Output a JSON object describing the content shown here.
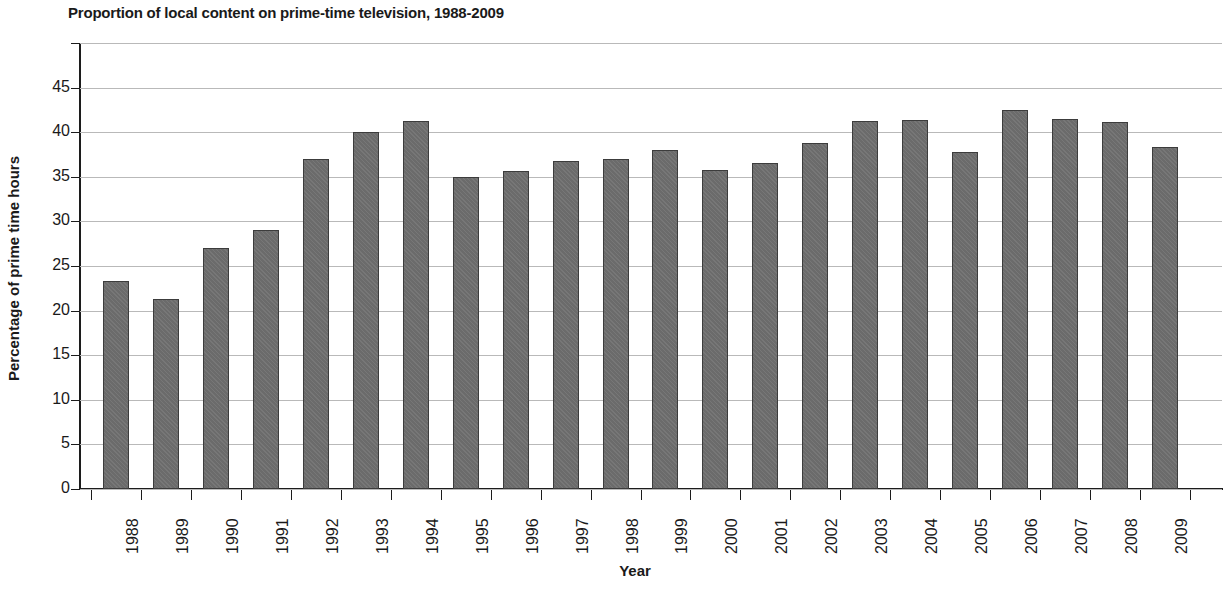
{
  "chart_data": {
    "type": "bar",
    "title": "Proportion of local content on prime-time television, 1988-2009",
    "xlabel": "Year",
    "ylabel": "Percentage of prime time hours",
    "categories": [
      "1988",
      "1989",
      "1990",
      "1991",
      "1992",
      "1993",
      "1994",
      "1995",
      "1996",
      "1997",
      "1998",
      "1999",
      "2000",
      "2001",
      "2002",
      "2003",
      "2004",
      "2005",
      "2006",
      "2007",
      "2008",
      "2009"
    ],
    "values": [
      23.3,
      21.3,
      27.0,
      29.0,
      37.0,
      40.0,
      41.2,
      35.0,
      35.7,
      36.8,
      37.0,
      38.0,
      35.8,
      36.6,
      38.8,
      41.2,
      41.4,
      37.8,
      42.5,
      41.5,
      41.1,
      38.3
    ],
    "ylim": [
      0,
      50
    ],
    "ytick_labels": [
      "0",
      "5",
      "10",
      "15",
      "20",
      "25",
      "30",
      "35",
      "40",
      "45"
    ],
    "ytick_values": [
      0,
      5,
      10,
      15,
      20,
      25,
      30,
      35,
      40,
      45
    ],
    "grid": true,
    "grid_color": "#b9b9b9",
    "legend": null,
    "bar_color": "#6f6f6f",
    "bar_edge_color": "#3c3c3c",
    "axis_color": "#1c1c1c",
    "text_color": "#1a1a1a"
  }
}
